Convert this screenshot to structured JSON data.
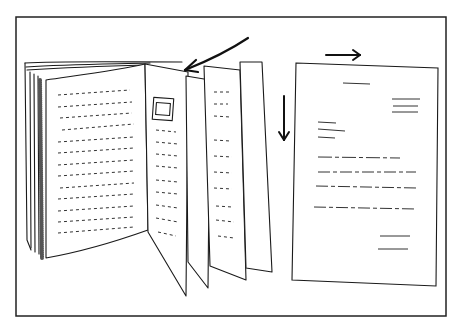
{
  "illustration": {
    "description": "Hand-drawn sketch: an open bound book with loose pages fanning out, an arrow pointing at the page edges, next to a single document page with a right arrow above and a down arrow beside it",
    "colors": {
      "ink": "#1a1a1a",
      "paper": "#ffffff",
      "frame": "#222222"
    },
    "elements": {
      "book": {
        "label": "open-book"
      },
      "document": {
        "label": "single-page-document"
      },
      "arrows": [
        "arrow-pointing-to-book-pages",
        "arrow-right",
        "arrow-down"
      ]
    }
  }
}
